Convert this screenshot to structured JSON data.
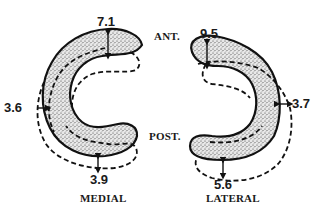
{
  "figure": {
    "orientation": {
      "anterior": "ANT.",
      "posterior": "POST."
    },
    "menisci": [
      {
        "name": "MEDIAL",
        "measurements": [
          {
            "location": "anterior",
            "value": "7.1"
          },
          {
            "location": "medial-side",
            "value": "3.6"
          },
          {
            "location": "posterior",
            "value": "3.9"
          }
        ]
      },
      {
        "name": "LATERAL",
        "measurements": [
          {
            "location": "anterior",
            "value": "9.5"
          },
          {
            "location": "lateral-side",
            "value": "3.7"
          },
          {
            "location": "posterior",
            "value": "5.6"
          }
        ]
      }
    ],
    "legend": {
      "solid_outline": "original meniscus position",
      "dashed_outline": "displaced meniscus position"
    }
  }
}
